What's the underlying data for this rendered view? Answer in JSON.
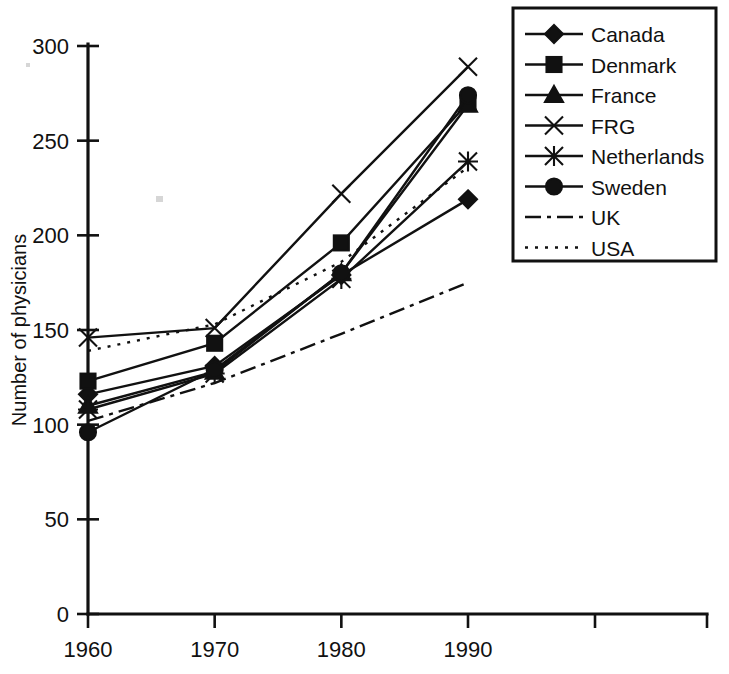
{
  "chart_data": {
    "type": "line",
    "title": "",
    "xlabel": "",
    "ylabel": "Number of physicians",
    "x": [
      1960,
      1970,
      1980,
      1990
    ],
    "xticklabels": [
      "1960",
      "1970",
      "1980",
      "1990"
    ],
    "yticks": [
      0,
      50,
      100,
      150,
      200,
      250,
      300
    ],
    "yticklabels": [
      "0",
      "50",
      "100",
      "150",
      "200",
      "250",
      "300"
    ],
    "ylim": [
      0,
      300
    ],
    "xlim": [
      1960,
      1990
    ],
    "grid": false,
    "legend_position": "top-right",
    "series": [
      {
        "name": "Canada",
        "marker": "diamond",
        "linestyle": "solid",
        "values": [
          116,
          131,
          179,
          219
        ]
      },
      {
        "name": "Denmark",
        "marker": "square",
        "linestyle": "solid",
        "values": [
          123,
          143,
          196,
          270
        ]
      },
      {
        "name": "France",
        "marker": "triangle",
        "linestyle": "solid",
        "values": [
          110,
          128,
          180,
          269
        ]
      },
      {
        "name": "FRG",
        "marker": "x",
        "linestyle": "solid",
        "values": [
          146,
          151,
          222,
          289
        ]
      },
      {
        "name": "Netherlands",
        "marker": "star",
        "linestyle": "solid",
        "values": [
          108,
          127,
          177,
          239
        ]
      },
      {
        "name": "Sweden",
        "marker": "circle",
        "linestyle": "solid",
        "values": [
          96,
          129,
          180,
          274
        ]
      },
      {
        "name": "UK",
        "marker": "none",
        "linestyle": "dashdot",
        "values": [
          102,
          122,
          148,
          175
        ]
      },
      {
        "name": "USA",
        "marker": "none",
        "linestyle": "dotted",
        "values": [
          139,
          153,
          186,
          236
        ]
      }
    ]
  },
  "legend": {
    "entries": [
      {
        "label": "Canada"
      },
      {
        "label": "Denmark"
      },
      {
        "label": "France"
      },
      {
        "label": "FRG"
      },
      {
        "label": "Netherlands"
      },
      {
        "label": "Sweden"
      },
      {
        "label": "UK"
      },
      {
        "label": "USA"
      }
    ]
  }
}
